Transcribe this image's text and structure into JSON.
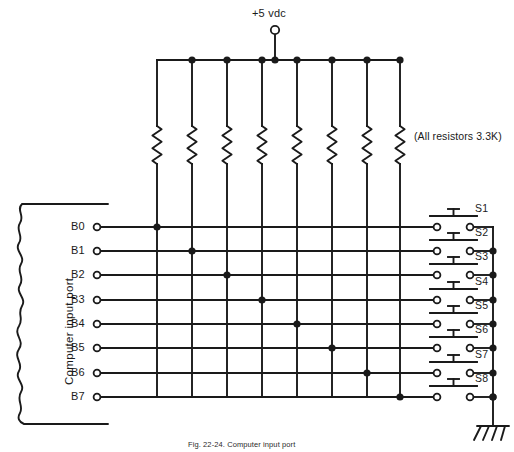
{
  "figure": {
    "caption": "Fig. 22-24. Computer input port",
    "ink_color": "#1a1a1a",
    "background_color": "#ffffff"
  },
  "supply": {
    "label": "+5 vdc",
    "terminal_icon": "open-circle-terminal"
  },
  "notes": {
    "resistor_note": "(All resistors 3.3K)"
  },
  "port": {
    "label": "Computer input port",
    "edge_style": "torn-paper-break",
    "terminals": [
      {
        "label": "B0"
      },
      {
        "label": "B1"
      },
      {
        "label": "B2"
      },
      {
        "label": "B3"
      },
      {
        "label": "B4"
      },
      {
        "label": "B5"
      },
      {
        "label": "B6"
      },
      {
        "label": "B7"
      }
    ]
  },
  "resistors": {
    "count": 8,
    "value": "3.3K",
    "symbol": "zigzag-resistor"
  },
  "switches": [
    {
      "label": "S1",
      "type": "pushbutton-normally-open"
    },
    {
      "label": "S2",
      "type": "pushbutton-normally-open"
    },
    {
      "label": "S3",
      "type": "pushbutton-normally-open"
    },
    {
      "label": "S4",
      "type": "pushbutton-normally-open"
    },
    {
      "label": "S5",
      "type": "pushbutton-normally-open"
    },
    {
      "label": "S6",
      "type": "pushbutton-normally-open"
    },
    {
      "label": "S7",
      "type": "pushbutton-normally-open"
    },
    {
      "label": "S8",
      "type": "pushbutton-normally-open"
    }
  ],
  "ground": {
    "symbol": "earth-ground-hatched"
  },
  "geometry": {
    "rail_y": 60,
    "supply_x": 275,
    "supply_terminal_y": 30,
    "resistor_xs": [
      157,
      192,
      227,
      262,
      297,
      332,
      367,
      400
    ],
    "row_ys": [
      227,
      251,
      275,
      300,
      324,
      348,
      373,
      397
    ],
    "port_terminal_x": 97,
    "switch_left_terminal_x": 437,
    "switch_right_terminal_x": 470,
    "ground_bus_x": 493,
    "ground_y": 425
  }
}
